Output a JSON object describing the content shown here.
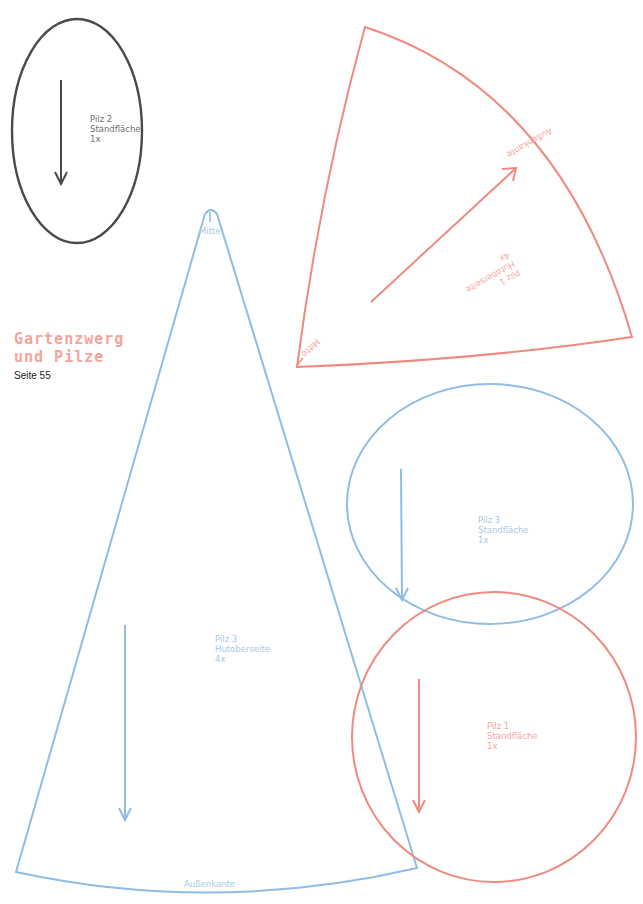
{
  "header": {
    "title_line1": "Gartenzwerg",
    "title_line2": "und Pilze",
    "page_ref": "Seite 55"
  },
  "colors": {
    "dark": "#4a4a4a",
    "blue": "#8fbde6",
    "pink": "#f08a80",
    "title_pink": "#f3a49b"
  },
  "pieces": {
    "pilz2_base": {
      "name": "Pilz 2",
      "part": "Standfläche",
      "count": "1x",
      "shape": "circle",
      "color": "dark"
    },
    "pilz1_cap_top": {
      "name": "Pilz 1",
      "part": "Hutoberseite",
      "count": "4x",
      "shape": "wedge",
      "color": "pink",
      "edge_outer": "Außenkante",
      "edge_center": "Mitte"
    },
    "pilz3_cap_top": {
      "name": "Pilz 3",
      "part": "Hutoberseite",
      "count": "4x",
      "shape": "wedge",
      "color": "blue",
      "edge_outer": "Außenkante",
      "edge_center": "Mitte"
    },
    "pilz3_base": {
      "name": "Pilz 3",
      "part": "Standfläche",
      "count": "1x",
      "shape": "circle",
      "color": "blue"
    },
    "pilz1_base": {
      "name": "Pilz 1",
      "part": "Standfläche",
      "count": "1x",
      "shape": "circle",
      "color": "pink"
    }
  }
}
